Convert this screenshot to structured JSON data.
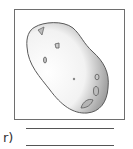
{
  "exercise": {
    "item_label": "r)",
    "image": {
      "subject": "potato-illustration",
      "colors": {
        "outline": "#5a5a5a",
        "shade_dark": "#8c8c8c",
        "shade_light": "#ffffff",
        "frame": "#6e6e6e"
      }
    },
    "answer_lines": [
      {
        "value": ""
      },
      {
        "value": ""
      }
    ]
  }
}
